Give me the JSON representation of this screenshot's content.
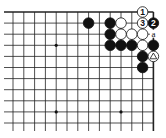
{
  "diagram": {
    "type": "go-board-partial",
    "grid": {
      "cols": 14,
      "rows": 11,
      "x0": 13,
      "dx": 10.8,
      "y0": 12,
      "dy": 11.1,
      "top_edge": true,
      "right_edge": true,
      "left_cut": true,
      "bottom_cut": true
    },
    "star_points": [
      [
        4,
        3
      ],
      [
        4,
        9
      ],
      [
        10,
        9
      ]
    ],
    "stones": [
      {
        "col": 7,
        "row": 1,
        "color": "black",
        "label": ""
      },
      {
        "col": 9,
        "row": 1,
        "color": "black",
        "label": ""
      },
      {
        "col": 10,
        "row": 1,
        "color": "white",
        "label": ""
      },
      {
        "col": 12,
        "row": 0,
        "color": "white",
        "label": "1"
      },
      {
        "col": 13,
        "row": 1,
        "color": "black",
        "label": "2"
      },
      {
        "col": 12,
        "row": 1,
        "color": "white",
        "label": "3"
      },
      {
        "col": 9,
        "row": 2,
        "color": "black",
        "label": ""
      },
      {
        "col": 10,
        "row": 2,
        "color": "white",
        "label": ""
      },
      {
        "col": 11,
        "row": 2,
        "color": "white",
        "label": ""
      },
      {
        "col": 12,
        "row": 2,
        "color": "white",
        "label": ""
      },
      {
        "col": 9,
        "row": 3,
        "color": "black",
        "label": ""
      },
      {
        "col": 10,
        "row": 3,
        "color": "black",
        "label": ""
      },
      {
        "col": 11,
        "row": 3,
        "color": "black",
        "label": ""
      },
      {
        "col": 12,
        "row": 3,
        "color": "white",
        "label": ""
      },
      {
        "col": 13,
        "row": 3,
        "color": "black",
        "label": ""
      },
      {
        "col": 12,
        "row": 4,
        "color": "black",
        "label": ""
      },
      {
        "col": 13,
        "row": 4,
        "color": "white",
        "label": "triangle"
      },
      {
        "col": 12,
        "row": 5,
        "color": "black",
        "label": ""
      }
    ],
    "point_labels": [
      {
        "col": 13,
        "row": 2,
        "text": "a"
      }
    ]
  }
}
